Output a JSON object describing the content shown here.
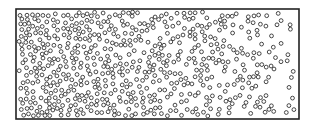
{
  "diagram": {
    "type": "particle-concentration-gradient",
    "frame": {
      "x": 16,
      "y": 9,
      "width": 283,
      "height": 110,
      "stroke": "#222222",
      "stroke_width": 1.6
    },
    "particles": {
      "count": 620,
      "radius": 1.9,
      "stroke": "#333333",
      "stroke_width": 0.9,
      "density_left": 1.0,
      "density_right": 0.08,
      "seed": 7
    },
    "colors": {
      "background": "#ffffff",
      "ink": "#222222"
    }
  }
}
